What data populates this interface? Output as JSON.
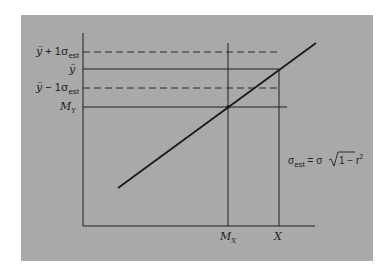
{
  "colors": {
    "panel": "#a9a9a9",
    "ink": "#1e1e1e",
    "page": "#ffffff"
  },
  "y_labels": {
    "upper": {
      "base": "ỹ",
      "op": " + 1",
      "sigma": "σ",
      "sub": "est"
    },
    "predicted": {
      "base": "ỹ"
    },
    "lower": {
      "base": "ỹ",
      "op": " − 1",
      "sigma": "σ",
      "sub": "est"
    },
    "mean": {
      "base": "M",
      "sub": "Y"
    }
  },
  "x_labels": {
    "mean": {
      "base": "M",
      "sub": "X"
    },
    "value": {
      "base": "X"
    }
  },
  "formula": {
    "lhs_sigma": "σ",
    "lhs_sub": "est",
    "eq": " = σ",
    "radicand": "1 − r",
    "exp": "2"
  }
}
